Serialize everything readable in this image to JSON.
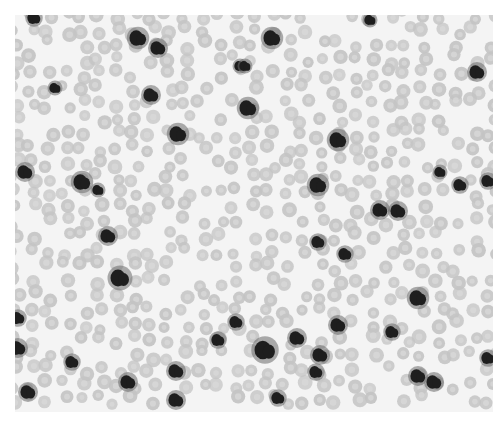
{
  "image": {
    "description": "Grayscale micrograph of blood smear with red blood cells and dark-stained leukocytes",
    "frame": {
      "x": 15,
      "y": 15,
      "width": 478,
      "height": 397
    },
    "background": "#f4f4f4",
    "rbc_color": "#c4c4c4",
    "rbc_center": "#d8d8d8",
    "wbc_color": "#1e1e1e",
    "wbc_halo": "#6a6a6a"
  },
  "leukocytes": [
    [
      34,
      18,
      7
    ],
    [
      138,
      38,
      9
    ],
    [
      158,
      48,
      8
    ],
    [
      272,
      38,
      9
    ],
    [
      240,
      66,
      6
    ],
    [
      245,
      66,
      6
    ],
    [
      370,
      20,
      6
    ],
    [
      55,
      88,
      6
    ],
    [
      151,
      95,
      8
    ],
    [
      248,
      108,
      9
    ],
    [
      178,
      134,
      9
    ],
    [
      338,
      140,
      9
    ],
    [
      477,
      72,
      8
    ],
    [
      25,
      172,
      8
    ],
    [
      82,
      182,
      9
    ],
    [
      98,
      190,
      6
    ],
    [
      318,
      185,
      9
    ],
    [
      440,
      172,
      6
    ],
    [
      460,
      185,
      7
    ],
    [
      488,
      181,
      7
    ],
    [
      380,
      210,
      8
    ],
    [
      398,
      211,
      8
    ],
    [
      108,
      236,
      8
    ],
    [
      318,
      242,
      7
    ],
    [
      345,
      254,
      7
    ],
    [
      120,
      278,
      10
    ],
    [
      18,
      318,
      7
    ],
    [
      236,
      322,
      7
    ],
    [
      218,
      340,
      7
    ],
    [
      418,
      298,
      9
    ],
    [
      18,
      348,
      8
    ],
    [
      265,
      350,
      11
    ],
    [
      297,
      338,
      8
    ],
    [
      320,
      355,
      8
    ],
    [
      338,
      325,
      8
    ],
    [
      392,
      332,
      7
    ],
    [
      72,
      362,
      7
    ],
    [
      128,
      382,
      8
    ],
    [
      176,
      371,
      8
    ],
    [
      176,
      400,
      8
    ],
    [
      278,
      398,
      7
    ],
    [
      316,
      372,
      7
    ],
    [
      418,
      376,
      8
    ],
    [
      434,
      382,
      8
    ],
    [
      488,
      358,
      7
    ],
    [
      28,
      392,
      8
    ]
  ],
  "rbc_grid": {
    "spacing": 17,
    "radius": 6.5,
    "jitter": 5
  }
}
